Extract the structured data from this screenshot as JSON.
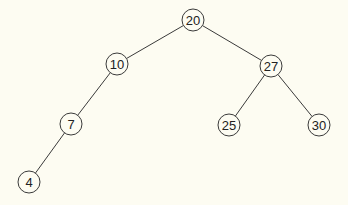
{
  "diagram": {
    "type": "binary-search-tree",
    "colors": {
      "background": "#fdfcf2",
      "stroke": "#3a3a3a",
      "text": "#222222"
    },
    "node_radius": 11,
    "nodes": [
      {
        "id": "n20",
        "label": "20",
        "x": 193,
        "y": 20
      },
      {
        "id": "n10",
        "label": "10",
        "x": 117,
        "y": 64
      },
      {
        "id": "n27",
        "label": "27",
        "x": 271,
        "y": 66
      },
      {
        "id": "n7",
        "label": "7",
        "x": 71,
        "y": 124
      },
      {
        "id": "n25",
        "label": "25",
        "x": 229,
        "y": 125
      },
      {
        "id": "n30",
        "label": "30",
        "x": 319,
        "y": 125
      },
      {
        "id": "n4",
        "label": "4",
        "x": 29,
        "y": 182
      }
    ],
    "edges": [
      {
        "from": "n20",
        "to": "n10"
      },
      {
        "from": "n20",
        "to": "n27"
      },
      {
        "from": "n10",
        "to": "n7"
      },
      {
        "from": "n27",
        "to": "n25"
      },
      {
        "from": "n27",
        "to": "n30"
      },
      {
        "from": "n7",
        "to": "n4"
      }
    ]
  }
}
